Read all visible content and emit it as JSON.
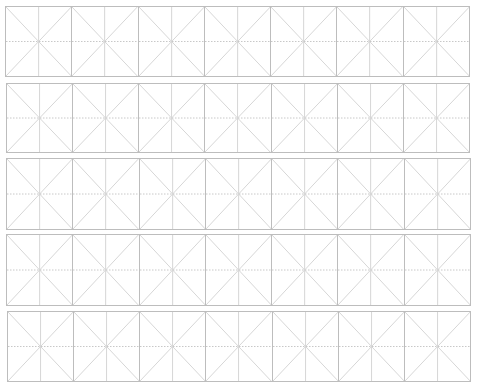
{
  "sheet": {
    "type": "mi-zi-ge practice grid",
    "rows_count": 5,
    "columns_per_row": 7,
    "colors": {
      "border": "#bdbdbd",
      "guide_solid": "#d6d6d6",
      "guide_dotted": "#c8c8c8",
      "background": "#ffffff"
    },
    "rows": [
      {
        "left": 5,
        "top": 6,
        "width": 465,
        "height": 71
      },
      {
        "left": 6,
        "top": 83,
        "width": 464,
        "height": 70
      },
      {
        "left": 6,
        "top": 158,
        "width": 465,
        "height": 72
      },
      {
        "left": 6,
        "top": 234,
        "width": 465,
        "height": 72
      },
      {
        "left": 7,
        "top": 311,
        "width": 464,
        "height": 71
      }
    ]
  }
}
